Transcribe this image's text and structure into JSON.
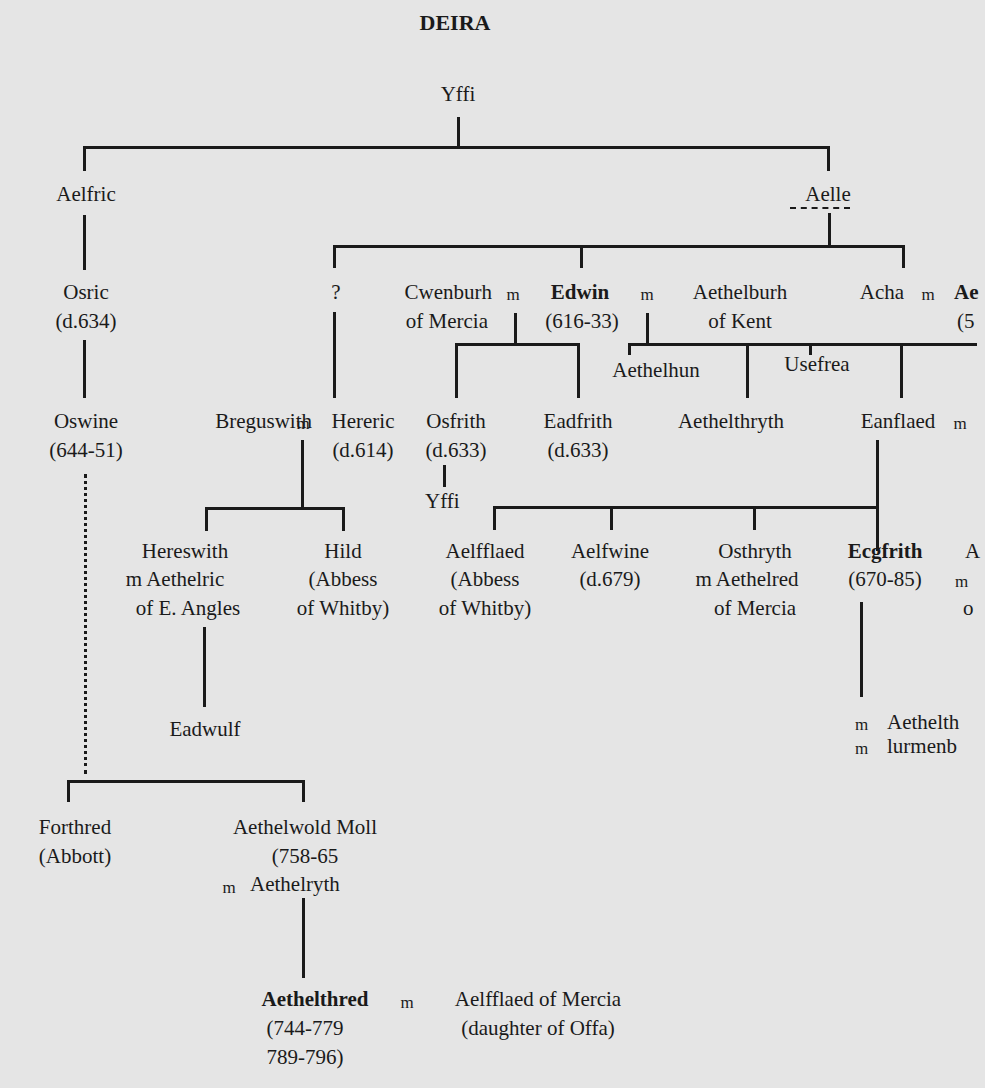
{
  "title": "DEIRA",
  "marriage_symbol": "m",
  "people": {
    "yffi_root": {
      "name": "Yffi"
    },
    "aelfric": {
      "name": "Aelfric"
    },
    "aelle": {
      "name": "Aelle"
    },
    "osric": {
      "name": "Osric",
      "dates": "(d.634)"
    },
    "oswine": {
      "name": "Oswine",
      "dates": "(644-51)"
    },
    "unknown": {
      "name": "?"
    },
    "cwenburh": {
      "name": "Cwenburh",
      "note": "of Mercia"
    },
    "edwin": {
      "name": "Edwin",
      "dates": "(616-33)"
    },
    "aethelburh": {
      "name": "Aethelburh",
      "note": "of Kent"
    },
    "acha": {
      "name": "Acha"
    },
    "acha_spouse": {
      "name": "Ae",
      "dates": "(5"
    },
    "breguswith": {
      "name": "Breguswith"
    },
    "hereric": {
      "name": "Hereric",
      "dates": "(d.614)"
    },
    "osfrith": {
      "name": "Osfrith",
      "dates": "(d.633)"
    },
    "yffi_grandson": {
      "name": "Yffi"
    },
    "eadfrith": {
      "name": "Eadfrith",
      "dates": "(d.633)"
    },
    "aethelhun": {
      "name": "Aethelhun"
    },
    "usefrea": {
      "name": "Usefrea"
    },
    "aethelthryth": {
      "name": "Aethelthryth"
    },
    "eanflaed": {
      "name": "Eanflaed"
    },
    "hereswith": {
      "name": "Hereswith",
      "spouse_line": "m Aethelric",
      "note": "of E. Angles"
    },
    "hild": {
      "name": "Hild",
      "note1": "(Abbess",
      "note2": "of Whitby)"
    },
    "eadwulf": {
      "name": "Eadwulf"
    },
    "aelfflaed_abbess": {
      "name": "Aelfflaed",
      "note1": "(Abbess",
      "note2": "of Whitby)"
    },
    "aelfwine": {
      "name": "Aelfwine",
      "dates": "(d.679)"
    },
    "osthryth": {
      "name": "Osthryth",
      "spouse_line": "m Aethelred",
      "note": "of Mercia"
    },
    "ecgfrith": {
      "name": "Ecgfrith",
      "dates": "(670-85)"
    },
    "ecgfrith_sibling": {
      "name": "A",
      "line2": "m",
      "line3": "o"
    },
    "ecgfrith_spouses": {
      "line1": "Aethelth",
      "line2": "lurmenb"
    },
    "forthred": {
      "name": "Forthred",
      "note": "(Abbott)"
    },
    "aethelwold": {
      "name": "Aethelwold Moll",
      "dates": "(758-65",
      "spouse_line": "Aethelryth"
    },
    "aethelthred": {
      "name": "Aethelthred",
      "dates1": "(744-779",
      "dates2": "789-796)"
    },
    "aelfflaed_mercia": {
      "name": "Aelfflaed of Mercia",
      "note": "(daughter of Offa)"
    }
  }
}
